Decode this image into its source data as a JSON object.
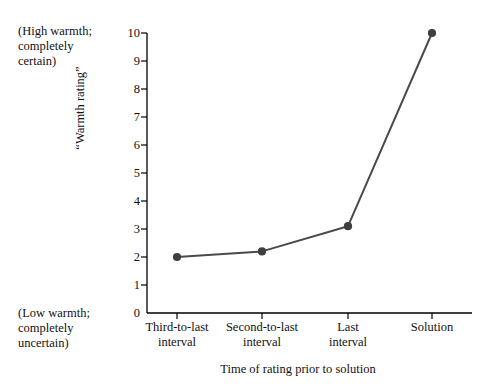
{
  "chart_data": {
    "type": "line",
    "title": "",
    "xlabel": "Time of rating prior to solution",
    "ylabel": "“Warmth rating”",
    "categories": [
      "Third-to-last\ninterval",
      "Second-to-last\ninterval",
      "Last\ninterval",
      "Solution"
    ],
    "values": [
      2.0,
      2.2,
      3.1,
      10.0
    ],
    "ylim": [
      0,
      10
    ],
    "yticks": [
      0,
      1,
      2,
      3,
      4,
      5,
      6,
      7,
      8,
      9,
      10
    ],
    "ytick_labels": [
      "0",
      "1",
      "2",
      "3",
      "4",
      "5",
      "6",
      "7",
      "8",
      "9",
      "10"
    ],
    "grid": false,
    "legend": "none",
    "series": [
      {
        "name": "Warmth rating",
        "values": [
          2.0,
          2.2,
          3.1,
          10.0
        ],
        "color": "#4a4a4a",
        "marker": "circle"
      }
    ],
    "annotations": [
      {
        "id": "high-warmth",
        "text": "(High warmth;\ncompletely\ncertain)",
        "position": "top-left"
      },
      {
        "id": "low-warmth",
        "text": "(Low warmth;\ncompletely\nuncertain)",
        "position": "bottom-left"
      }
    ]
  },
  "colors": {
    "line": "#4a4a4a",
    "marker": "#3f3f3f",
    "axis": "#000000",
    "text": "#111111",
    "background": "#ffffff"
  }
}
